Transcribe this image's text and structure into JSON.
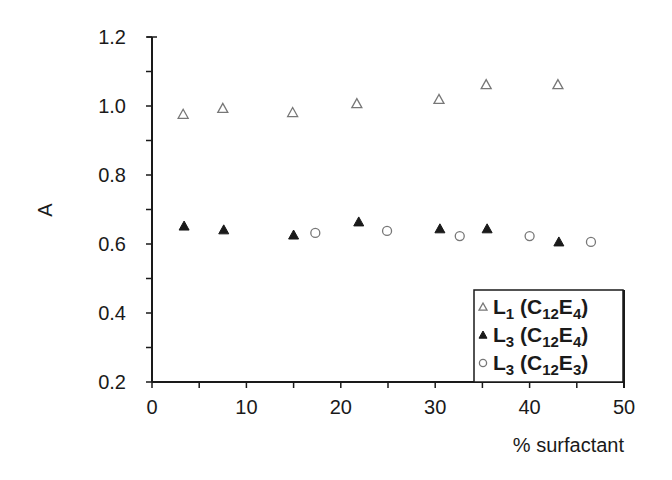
{
  "chart_data": {
    "type": "scatter",
    "title": "",
    "xlabel": "% surfactant",
    "ylabel": "A",
    "xlim": [
      0,
      50
    ],
    "ylim": [
      0.2,
      1.2
    ],
    "x_ticks": [
      0,
      10,
      20,
      30,
      40,
      50
    ],
    "x_tick_labels": [
      "0",
      "10",
      "20",
      "30",
      "40",
      "50"
    ],
    "y_ticks": [
      0.2,
      0.4,
      0.6,
      0.8,
      1.0,
      1.2
    ],
    "y_tick_labels": [
      "0.2",
      "0.4",
      "0.6",
      "0.8",
      "1.0",
      "1.2"
    ],
    "grid": false,
    "legend_position": "lower right",
    "series": [
      {
        "name": "L1 (C12E4)",
        "marker": "open-triangle",
        "x": [
          3.3,
          7.5,
          14.9,
          21.7,
          30.4,
          35.4,
          43.0
        ],
        "y": [
          0.976,
          0.993,
          0.981,
          1.007,
          1.019,
          1.062,
          1.062
        ]
      },
      {
        "name": "L3 (C12E4)",
        "marker": "filled-triangle",
        "x": [
          3.4,
          7.6,
          15.0,
          21.9,
          30.5,
          35.5,
          43.1
        ],
        "y": [
          0.652,
          0.641,
          0.626,
          0.664,
          0.644,
          0.644,
          0.606
        ]
      },
      {
        "name": "L3 (C12E3)",
        "marker": "open-circle",
        "x": [
          17.3,
          24.9,
          32.6,
          40.0,
          46.5
        ],
        "y": [
          0.632,
          0.638,
          0.623,
          0.623,
          0.606
        ]
      }
    ]
  },
  "legend": [
    {
      "main": "L",
      "sub1": "1",
      "paren_open": "(C",
      "sub2": "12",
      "e": "E",
      "sub3": "4",
      "paren_close": ")"
    },
    {
      "main": "L",
      "sub1": "3",
      "paren_open": "(C",
      "sub2": "12",
      "e": "E",
      "sub3": "4",
      "paren_close": ")"
    },
    {
      "main": "L",
      "sub1": "3",
      "paren_open": "(C",
      "sub2": "12",
      "e": "E",
      "sub3": "3",
      "paren_close": ")"
    }
  ],
  "colors": {
    "ink": "#1a1a1a",
    "open_marker": "#777777",
    "background": "#ffffff"
  }
}
